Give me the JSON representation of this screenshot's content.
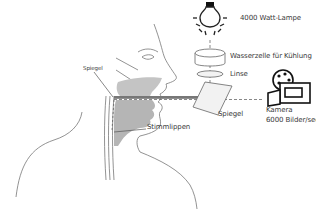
{
  "labels": {
    "lamp": "4000 Watt-Lampe",
    "water_cell": "Wasserzelle für Kühlung",
    "lens": "Linse",
    "mirror_main": "Spiegel",
    "mirror_small": "Spiegel",
    "vocal_folds": "Stimmlippen",
    "camera_line1": "Kamera",
    "camera_line2": "6000 Bilder/sec"
  },
  "icons": [
    "light-bulb-icon",
    "water-cell-cylinder",
    "lens-ellipse",
    "mirror-plate",
    "film-camera-icon",
    "head-profile-illustration"
  ],
  "colors": {
    "line": "#555555",
    "text": "#3a3a3a",
    "fill_gray": "#b5b5b5",
    "mirror_fill": "#f2f2f2",
    "background": "#ffffff"
  }
}
